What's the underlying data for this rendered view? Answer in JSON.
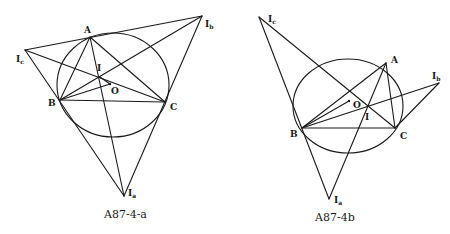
{
  "figures": [
    {
      "caption": "A87-4-a",
      "labels": {
        "A": "A",
        "B": "B",
        "C": "C",
        "O": "O",
        "I": "I",
        "Ia_main": "I",
        "Ia_sub": "a",
        "Ib_main": "I",
        "Ib_sub": "b",
        "Ic_main": "I",
        "Ic_sub": "c"
      },
      "points": {
        "A": [
          90,
          37
        ],
        "B": [
          60,
          100
        ],
        "C": [
          165,
          102
        ],
        "O": [
          110,
          84
        ],
        "I": [
          100,
          77
        ],
        "Ia": [
          124,
          196
        ],
        "Ib": [
          202,
          16
        ],
        "Ic": [
          25,
          50
        ]
      },
      "circle": {
        "cx": 113,
        "cy": 85,
        "rx": 56,
        "ry": 52
      }
    },
    {
      "caption": "A87-4b",
      "labels": {
        "A": "A",
        "B": "B",
        "C": "C",
        "O": "O",
        "I": "I",
        "Ia_main": "I",
        "Ia_sub": "a",
        "Ib_main": "I",
        "Ib_sub": "b",
        "Ic_main": "I",
        "Ic_sub": "c"
      },
      "points": {
        "A": [
          386,
          63
        ],
        "B": [
          302,
          128
        ],
        "C": [
          395,
          128
        ],
        "O": [
          349,
          101
        ],
        "I": [
          367,
          106
        ],
        "Ia": [
          329,
          199
        ],
        "Ib": [
          439,
          83
        ],
        "Ic": [
          259,
          17
        ]
      },
      "circle": {
        "cx": 348,
        "cy": 106,
        "rx": 55,
        "ry": 47
      }
    }
  ]
}
